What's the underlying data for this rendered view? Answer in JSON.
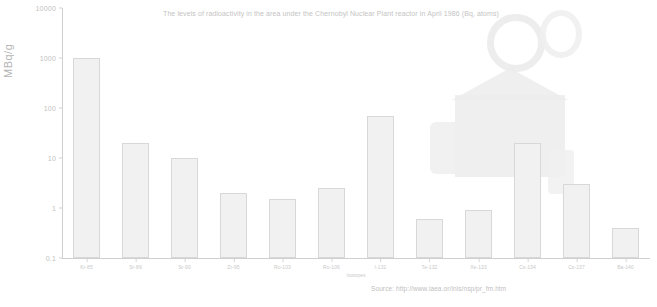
{
  "chart_data": {
    "type": "bar",
    "title": "The levels of radioactivity in the area under the Chernobyl Nuclear Plant reactor in April 1986 (Bq, atoms)",
    "xlabel": "Isotopes",
    "ylabel": "MBq/g",
    "scale": "log",
    "ylim": [
      0.1,
      10000
    ],
    "ytick_labels": [
      "10000",
      "1000",
      "100",
      "10",
      "1",
      "0.1"
    ],
    "ytick_values": [
      10000,
      1000,
      100,
      10,
      1,
      0.1
    ],
    "grid": false,
    "legend": "none",
    "categories": [
      "Kr-85",
      "Sr-89",
      "Sr-90",
      "Zr-95",
      "Ru-103",
      "Ru-106",
      "I-131",
      "Te-132",
      "Xe-133",
      "Cs-134",
      "Cs-137",
      "Ba-140"
    ],
    "values": [
      1000,
      20,
      10,
      2,
      1.5,
      2.5,
      70,
      0.6,
      0.9,
      20,
      3,
      0.4
    ],
    "series": [
      {
        "name": "Radioactivity",
        "values": [
          1000,
          20,
          10,
          2,
          1.5,
          2.5,
          70,
          0.6,
          0.9,
          20,
          3,
          0.4
        ]
      }
    ],
    "source": "Source: http://www.iaea.or/inis/nsp/pr_fm.htm",
    "colors": {
      "bar_fill": "#f1f1f1",
      "bar_stroke": "#d8d8d8",
      "axis": "#cfcfcf",
      "text": "#c2c2c2",
      "background": "#ffffff"
    }
  }
}
